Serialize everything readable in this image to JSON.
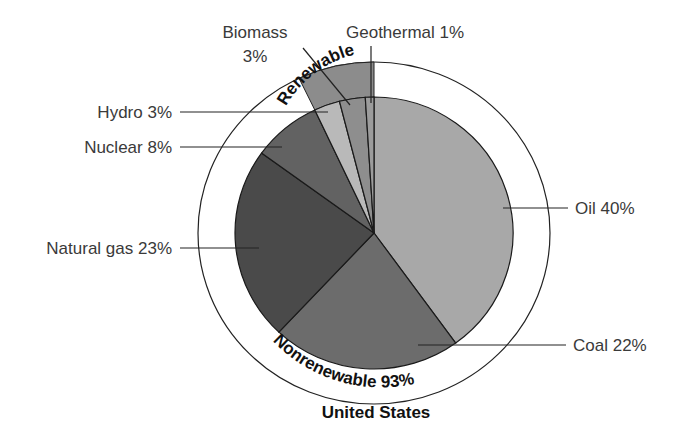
{
  "chart_data": {
    "type": "pie",
    "title": "United States",
    "categories": [
      "Oil",
      "Coal",
      "Natural gas",
      "Nuclear",
      "Hydro",
      "Biomass",
      "Geothermal"
    ],
    "values": [
      40,
      22,
      23,
      8,
      3,
      3,
      1
    ],
    "unit": "%",
    "groups": [
      {
        "name": "Nonrenewable",
        "value": 93,
        "members": [
          "Oil",
          "Coal",
          "Natural gas",
          "Nuclear"
        ]
      },
      {
        "name": "Renewable",
        "value": 7,
        "members": [
          "Hydro",
          "Biomass",
          "Geothermal"
        ]
      }
    ],
    "colors": {
      "Oil": "#a8a8a8",
      "Coal": "#6c6c6c",
      "Natural gas": "#4a4a4a",
      "Nuclear": "#626262",
      "Hydro": "#b9b9b9",
      "Biomass": "#8e8e8e",
      "Geothermal": "#9c9c9c",
      "renewable_band": "#8c8c8c"
    }
  },
  "labels": {
    "oil": "Oil 40%",
    "coal": "Coal 22%",
    "natural_gas": "Natural gas 23%",
    "nuclear": "Nuclear 8%",
    "hydro": "Hydro 3%",
    "biomass_line1": "Biomass",
    "biomass_line2": "3%",
    "geothermal": "Geothermal 1%",
    "renewable_band": "Renewable",
    "nonrenewable_band": "Nonrenewable 93%",
    "title": "United States"
  }
}
